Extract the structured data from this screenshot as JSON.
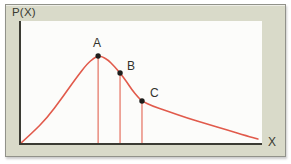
{
  "chart_data": {
    "type": "line",
    "title": "",
    "ylabel": "P(X)",
    "xlabel": "X",
    "x_ticks": [],
    "y_ticks": [],
    "axes_note": "qualitative unlabeled axes; right-skewed probability distribution of X",
    "legend": null,
    "grid": false,
    "curve_color": "#e15a4b",
    "dropline_color": "#e5705f",
    "point_color": "#1e1e1c",
    "axis_color": "#3b3b33",
    "frame_color": "#d9dac9",
    "curve_points_norm": [
      [
        0.0,
        0.0
      ],
      [
        0.046,
        0.082
      ],
      [
        0.108,
        0.205
      ],
      [
        0.17,
        0.369
      ],
      [
        0.232,
        0.541
      ],
      [
        0.274,
        0.648
      ],
      [
        0.303,
        0.697
      ],
      [
        0.32,
        0.713
      ],
      [
        0.336,
        0.709
      ],
      [
        0.361,
        0.68
      ],
      [
        0.386,
        0.631
      ],
      [
        0.411,
        0.574
      ],
      [
        0.436,
        0.508
      ],
      [
        0.461,
        0.434
      ],
      [
        0.485,
        0.377
      ],
      [
        0.502,
        0.344
      ],
      [
        0.544,
        0.303
      ],
      [
        0.606,
        0.262
      ],
      [
        0.689,
        0.205
      ],
      [
        0.772,
        0.156
      ],
      [
        0.855,
        0.107
      ],
      [
        0.938,
        0.057
      ],
      [
        0.983,
        0.033
      ]
    ],
    "marked_points": [
      {
        "label": "A",
        "x": 0.32,
        "y": 0.713,
        "dropline": true,
        "label_dx": -1,
        "label_dy": -9,
        "label_anchor": "middle"
      },
      {
        "label": "B",
        "x": 0.411,
        "y": 0.574,
        "dropline": true,
        "label_dx": 7,
        "label_dy": -3,
        "label_anchor": "start"
      },
      {
        "label": "C",
        "x": 0.502,
        "y": 0.344,
        "dropline": true,
        "label_dx": 8,
        "label_dy": -4,
        "label_anchor": "start"
      }
    ]
  }
}
